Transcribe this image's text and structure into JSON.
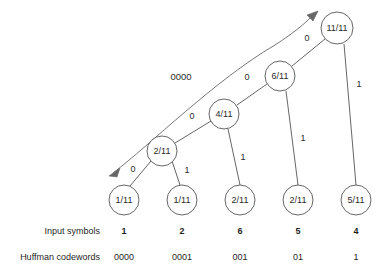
{
  "figure": {
    "kind": "huffman-tree-diagram",
    "width": 390,
    "height": 272,
    "stroke_color": "#555555",
    "text_color": "#1f1f1f",
    "background": "#ffffff"
  },
  "nodes": {
    "root": {
      "label": "11/11",
      "cx": 337,
      "cy": 28,
      "r": 16
    },
    "internal_6": {
      "label": "6/11",
      "cx": 280,
      "cy": 76,
      "r": 15
    },
    "internal_4": {
      "label": "4/11",
      "cx": 224,
      "cy": 114,
      "r": 15
    },
    "internal_2": {
      "label": "2/11",
      "cx": 162,
      "cy": 151,
      "r": 15
    },
    "leaf_1": {
      "label": "1/11",
      "cx": 124,
      "cy": 200,
      "r": 15
    },
    "leaf_2": {
      "label": "1/11",
      "cx": 182,
      "cy": 200,
      "r": 15
    },
    "leaf_3": {
      "label": "2/11",
      "cx": 240,
      "cy": 200,
      "r": 15
    },
    "leaf_4": {
      "label": "2/11",
      "cx": 298,
      "cy": 200,
      "r": 15
    },
    "leaf_5": {
      "label": "5/11",
      "cx": 356,
      "cy": 200,
      "r": 15
    }
  },
  "edge_labels": {
    "root_left": "0",
    "root_right": "1",
    "six_left": "0",
    "six_right": "1",
    "four_left": "0",
    "four_right": "1",
    "two_left": "0",
    "two_right": "1"
  },
  "sweep": {
    "label": "0000",
    "label_x": 181,
    "label_y": 77
  },
  "rows": {
    "input_symbols": {
      "label": "Input symbols",
      "values": [
        "1",
        "2",
        "6",
        "5",
        "4"
      ]
    },
    "huffman_codewords": {
      "label": "Huffman codewords",
      "values": [
        "0000",
        "0001",
        "001",
        "01",
        "1"
      ]
    }
  },
  "columns_x": [
    124,
    182,
    240,
    298,
    356
  ]
}
